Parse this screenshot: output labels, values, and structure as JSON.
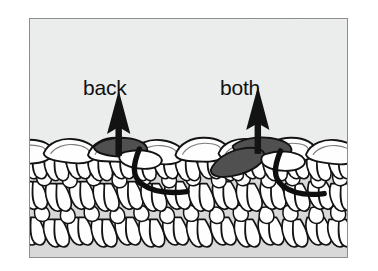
{
  "figure": {
    "type": "crochet-stitch-diagram",
    "title_visible": false,
    "frame": {
      "border_color": "#8d8d8d",
      "background_color": "#eceded"
    },
    "labels": [
      {
        "id": "back",
        "text": "back",
        "meaning": "insert hook under back loop only",
        "color": "#111111"
      },
      {
        "id": "both",
        "text": "both",
        "meaning": "insert hook under both loops",
        "color": "#111111"
      }
    ],
    "arrows": [
      {
        "id": "back-arrow",
        "direction": "up",
        "color": "#111111",
        "points_to": "back"
      },
      {
        "id": "both-arrow",
        "direction": "up",
        "color": "#111111",
        "points_to": "both"
      }
    ],
    "highlighted_loops": [
      {
        "id": "back-loop-highlight",
        "count": 1,
        "fill": "#4f4f4f",
        "description": "single shaded back loop of the top chain"
      },
      {
        "id": "both-loops-highlight",
        "count": 2,
        "fill": "#4f4f4f",
        "description": "both front and back loops of the top chain shaded"
      }
    ],
    "hook_paths": [
      {
        "id": "back-hook-path",
        "color": "#0d0d0d",
        "description": "thick curved line showing hook passing under the back loop"
      },
      {
        "id": "both-hook-path",
        "color": "#0d0d0d",
        "description": "thick curved line showing hook passing under both loops"
      }
    ],
    "fabric": {
      "stroke_color": "#111111",
      "loop_fill": "#ffffff",
      "shadow_fill": "#d8d8d8",
      "top_chain_loop_count": 11,
      "body_rows": 3,
      "description": "crocheted fabric swatch rendered in line art with a top chain row and rows of V-shaped single crochet stitches below"
    }
  }
}
